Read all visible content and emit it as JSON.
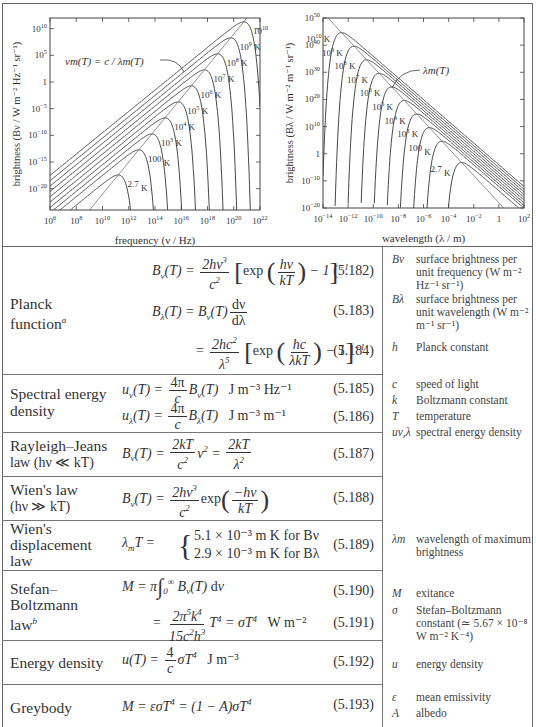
{
  "chart_data": [
    {
      "type": "line",
      "title": "Planck brightness per unit frequency",
      "xlabel": "frequency (ν / Hz)",
      "ylabel": "brightness (B_ν / W m⁻² Hz⁻¹ sr⁻¹)",
      "xscale": "log",
      "yscale": "log",
      "xlim": [
        1000000.0,
        1e+22
      ],
      "ylim": [
        1e-24,
        1000000000000.0
      ],
      "xticks": [
        "10^6",
        "10^8",
        "10^10",
        "10^12",
        "10^14",
        "10^16",
        "10^18",
        "10^20",
        "10^22"
      ],
      "yticks": [
        "10^10",
        "10^5",
        "1",
        "10^-5",
        "10^-10",
        "10^-15",
        "10^-20"
      ],
      "series": [
        {
          "name": "2.7 K",
          "T": 2.7
        },
        {
          "name": "100 K",
          "T": 100
        },
        {
          "name": "10^3 K",
          "T": 1000
        },
        {
          "name": "10^4 K",
          "T": 10000
        },
        {
          "name": "10^5 K",
          "T": 100000
        },
        {
          "name": "10^6 K",
          "T": 1000000
        },
        {
          "name": "10^7 K",
          "T": 10000000
        },
        {
          "name": "10^8 K",
          "T": 100000000
        },
        {
          "name": "10^9 K",
          "T": 1000000000
        },
        {
          "name": "10^10 K",
          "T": 10000000000
        }
      ],
      "annotation": "ν_m(T) = c / λ_m(T)",
      "grid": false
    },
    {
      "type": "line",
      "title": "Planck brightness per unit wavelength",
      "xlabel": "wavelength (λ / m)",
      "ylabel": "brightness (B_λ / W m⁻² m⁻¹ sr⁻¹)",
      "xscale": "log",
      "yscale": "log",
      "xlim": [
        1e-14,
        100.0
      ],
      "ylim": [
        1e-20,
        1e+50
      ],
      "xticks": [
        "10^-14",
        "10^-12",
        "10^-10",
        "10^-8",
        "10^-6",
        "10^-4",
        "10^-2",
        "1",
        "10^2"
      ],
      "yticks": [
        "10^50",
        "10^40",
        "10^30",
        "10^20",
        "10^10",
        "1",
        "10^-10",
        "10^-20"
      ],
      "series": [
        {
          "name": "2.7 K",
          "T": 2.7
        },
        {
          "name": "100 K",
          "T": 100
        },
        {
          "name": "10^3 K",
          "T": 1000
        },
        {
          "name": "10^4 K",
          "T": 10000
        },
        {
          "name": "10^5 K",
          "T": 100000
        },
        {
          "name": "10^6 K",
          "T": 1000000
        },
        {
          "name": "10^7 K",
          "T": 10000000
        },
        {
          "name": "10^8 K",
          "T": 100000000
        },
        {
          "name": "10^9 K",
          "T": 1000000000
        },
        {
          "name": "10^10 K",
          "T": 10000000000
        }
      ],
      "annotation": "λ_m(T)",
      "grid": false
    }
  ],
  "plots": {
    "left": {
      "xlabel": "frequency (ν / Hz)",
      "ylabel": "brightness (Bν / W m⁻² Hz⁻¹ sr⁻¹)",
      "annotation": "νm(T) = c / λm(T)"
    },
    "right": {
      "xlabel": "wavelength (λ / m)",
      "ylabel": "brightness (Bλ / W m⁻² m⁻¹ sr⁻¹)",
      "annotation": "λm(T)"
    }
  },
  "rows": [
    {
      "label_line1": "Planck",
      "label_line2": "function",
      "label_sup": "a",
      "eq1_num": "(5.182)",
      "eq2_num": "(5.183)",
      "eq3_num": "(5.184)"
    },
    {
      "label_line1": "Spectral energy",
      "label_line2": "density",
      "eq1_num": "(5.185)",
      "eq2_num": "(5.186)",
      "eq1_units": "J m⁻³ Hz⁻¹",
      "eq2_units": "J m⁻³ m⁻¹"
    },
    {
      "label_line1": "Rayleigh–Jeans",
      "label_line2": "law (hν ≪ kT)",
      "eq1_num": "(5.187)"
    },
    {
      "label_line1": "Wien's law",
      "label_line2": "(hν ≫ kT)",
      "eq1_num": "(5.188)"
    },
    {
      "label_line1": "Wien's",
      "label_line2": "displacement",
      "label_line3": "law",
      "eq1_num": "(5.189)",
      "case1": "5.1 × 10⁻³ m K   for Bν",
      "case2": "2.9 × 10⁻³ m K   for Bλ"
    },
    {
      "label_line1": "Stefan–",
      "label_line2": "Boltzmann",
      "label_line3": "law",
      "label_sup": "b",
      "eq1_num": "(5.190)",
      "eq2_num": "(5.191)",
      "eq2_units": "W m⁻²"
    },
    {
      "label_line1": "Energy density",
      "eq1_num": "(5.192)",
      "eq1_units": "J m⁻³"
    },
    {
      "label_line1": "Greybody",
      "eq1_num": "(5.193)"
    }
  ],
  "glossary": [
    {
      "sym": "Bν",
      "desc": "surface brightness per unit frequency (W m⁻² Hz⁻¹ sr⁻¹)"
    },
    {
      "sym": "Bλ",
      "desc": "surface brightness per unit wavelength (W m⁻² m⁻¹ sr⁻¹)"
    },
    {
      "sym": "h",
      "desc": "Planck constant"
    },
    {
      "sym": "c",
      "desc": "speed of light"
    },
    {
      "sym": "k",
      "desc": "Boltzmann constant"
    },
    {
      "sym": "T",
      "desc": "temperature"
    },
    {
      "sym": "uν,λ",
      "desc": "spectral energy density"
    },
    {
      "sym": "λm",
      "desc": "wavelength of maximum brightness"
    },
    {
      "sym": "M",
      "desc": "exitance"
    },
    {
      "sym": "σ",
      "desc": "Stefan–Boltzmann constant (≃ 5.67 × 10⁻⁸ W m⁻² K⁻⁴)"
    },
    {
      "sym": "u",
      "desc": "energy density"
    },
    {
      "sym": "ε",
      "desc": "mean emissivity"
    },
    {
      "sym": "A",
      "desc": "albedo"
    }
  ]
}
